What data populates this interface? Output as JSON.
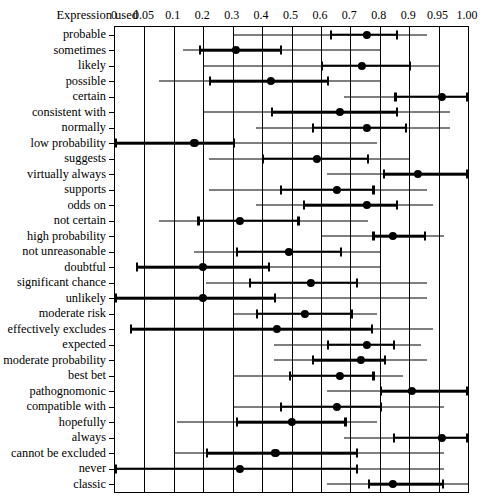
{
  "header": {
    "row_header": "Expression used"
  },
  "chart_data": {
    "type": "scatter",
    "title": "",
    "xlabel": "",
    "ylabel": "",
    "grid": true,
    "legend": null,
    "axis_scale": "probability (logit-like spacing)",
    "xticks": [
      0,
      0.05,
      0.1,
      0.2,
      0.3,
      0.4,
      0.5,
      0.6,
      0.7,
      0.8,
      0.9,
      0.95,
      1.0
    ],
    "xtick_labels": [
      "0",
      "0.05",
      "0.1",
      "0.2",
      "0.3",
      "0.4",
      "0.5",
      "0.6",
      "0.7",
      "0.8",
      "0.9",
      "0.95",
      "1.00"
    ],
    "xlim": [
      0,
      1.0
    ],
    "marker": "filled-circle-median",
    "elements": [
      "thin-line-range",
      "thick-line-interquartile",
      "end-caps",
      "median-dot"
    ],
    "categories": [
      "probable",
      "sometimes",
      "likely",
      "possible",
      "certain",
      "consistent with",
      "normally",
      "low probability",
      "suggests",
      "virtually always",
      "supports",
      "odds on",
      "not certain",
      "high probability",
      "not unreasonable",
      "doubtful",
      "significant chance",
      "unlikely",
      "moderate risk",
      "effectively excludes",
      "expected",
      "best bet",
      "moderate probability",
      "pathognomonic",
      "compatible with",
      "hopefully",
      "always",
      "cannot be excluded",
      "never",
      "classic"
    ],
    "rows": [
      {
        "label": "probable",
        "min": 0.3,
        "q1": 0.63,
        "median": 0.755,
        "q3": 0.855,
        "max": 0.93
      },
      {
        "label": "sometimes",
        "min": 0.13,
        "q1": 0.185,
        "median": 0.31,
        "q3": 0.46,
        "max": 0.8
      },
      {
        "label": "likely",
        "min": 0.2,
        "q1": 0.6,
        "median": 0.74,
        "q3": 0.9,
        "max": 0.95
      },
      {
        "label": "possible",
        "min": 0.075,
        "q1": 0.22,
        "median": 0.43,
        "q3": 0.62,
        "max": 0.8
      },
      {
        "label": "certain",
        "min": 0.68,
        "q1": 0.85,
        "median": 0.955,
        "q3": 1.0,
        "max": 1.0
      },
      {
        "label": "consistent with",
        "min": 0.2,
        "q1": 0.43,
        "median": 0.665,
        "q3": 0.855,
        "max": 0.97
      },
      {
        "label": "normally",
        "min": 0.38,
        "q1": 0.57,
        "median": 0.755,
        "q3": 0.885,
        "max": 0.97
      },
      {
        "label": "low probability",
        "min": 0.0,
        "q1": 0.0,
        "median": 0.17,
        "q3": 0.3,
        "max": 0.79
      },
      {
        "label": "suggests",
        "min": 0.22,
        "q1": 0.4,
        "median": 0.585,
        "q3": 0.755,
        "max": 0.9
      },
      {
        "label": "virtually always",
        "min": 0.62,
        "q1": 0.81,
        "median": 0.915,
        "q3": 1.0,
        "max": 1.0
      },
      {
        "label": "supports",
        "min": 0.22,
        "q1": 0.46,
        "median": 0.655,
        "q3": 0.775,
        "max": 0.93
      },
      {
        "label": "odds on",
        "min": 0.38,
        "q1": 0.54,
        "median": 0.755,
        "q3": 0.855,
        "max": 0.94
      },
      {
        "label": "not certain",
        "min": 0.075,
        "q1": 0.18,
        "median": 0.325,
        "q3": 0.52,
        "max": 0.76
      },
      {
        "label": "high probability",
        "min": 0.6,
        "q1": 0.775,
        "median": 0.845,
        "q3": 0.925,
        "max": 0.96
      },
      {
        "label": "not unreasonable",
        "min": 0.17,
        "q1": 0.31,
        "median": 0.49,
        "q3": 0.665,
        "max": 0.8
      },
      {
        "label": "doubtful",
        "min": 0.035,
        "q1": 0.035,
        "median": 0.2,
        "q3": 0.42,
        "max": 0.8
      },
      {
        "label": "significant chance",
        "min": 0.21,
        "q1": 0.355,
        "median": 0.565,
        "q3": 0.72,
        "max": 0.93
      },
      {
        "label": "unlikely",
        "min": 0.0,
        "q1": 0.0,
        "median": 0.2,
        "q3": 0.44,
        "max": 0.93
      },
      {
        "label": "moderate risk",
        "min": 0.3,
        "q1": 0.38,
        "median": 0.545,
        "q3": 0.7,
        "max": 0.79
      },
      {
        "label": "effectively excludes",
        "min": 0.025,
        "q1": 0.025,
        "median": 0.45,
        "q3": 0.77,
        "max": 0.94
      },
      {
        "label": "expected",
        "min": 0.44,
        "q1": 0.62,
        "median": 0.755,
        "q3": 0.845,
        "max": 0.92
      },
      {
        "label": "moderate probability",
        "min": 0.44,
        "q1": 0.57,
        "median": 0.735,
        "q3": 0.815,
        "max": 0.93
      },
      {
        "label": "best bet",
        "min": 0.3,
        "q1": 0.49,
        "median": 0.665,
        "q3": 0.775,
        "max": 0.88
      },
      {
        "label": "pathognomonic",
        "min": 0.62,
        "q1": 0.8,
        "median": 0.905,
        "q3": 1.0,
        "max": 1.0
      },
      {
        "label": "compatible with",
        "min": 0.3,
        "q1": 0.46,
        "median": 0.655,
        "q3": 0.8,
        "max": 0.96
      },
      {
        "label": "hopefully",
        "min": 0.11,
        "q1": 0.31,
        "median": 0.5,
        "q3": 0.68,
        "max": 0.79
      },
      {
        "label": "always",
        "min": 0.68,
        "q1": 0.845,
        "median": 0.955,
        "q3": 1.0,
        "max": 1.0
      },
      {
        "label": "cannot be excluded",
        "min": 0.1,
        "q1": 0.21,
        "median": 0.445,
        "q3": 0.72,
        "max": 0.96
      },
      {
        "label": "never",
        "min": 0.0,
        "q1": 0.0,
        "median": 0.325,
        "q3": 0.72,
        "max": 0.96
      },
      {
        "label": "classic",
        "min": 0.62,
        "q1": 0.76,
        "median": 0.845,
        "q3": 0.955,
        "max": 1.0
      }
    ]
  }
}
